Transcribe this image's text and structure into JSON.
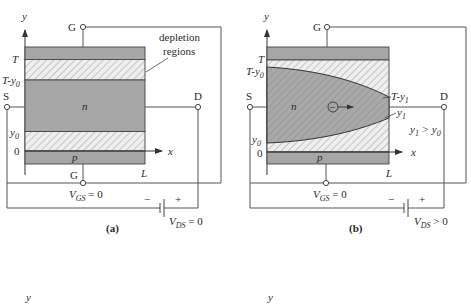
{
  "colors": {
    "channel": "#a6a6a6",
    "gate_region": "#a6a6a6",
    "depletion_bg": "#efefef",
    "hatch": "#9a9a9a",
    "wire": "#555555",
    "text": "#2a2a2a"
  },
  "panel_a": {
    "caption": "(a)",
    "axis_y": "y",
    "axis_x": "x",
    "terminal_gate_top": "G",
    "terminal_gate_bottom": "G",
    "terminal_source": "S",
    "terminal_drain": "D",
    "level_T": "T",
    "level_T_minus_y0": "T-y",
    "level_T_minus_y0_sub": "0",
    "level_y0": "y",
    "level_y0_sub": "0",
    "level_zero": "0",
    "length_label": "L",
    "channel_label": "n",
    "gate_bottom_label": "p",
    "annotation_line1": "depletion",
    "annotation_line2": "regions",
    "vgs_main": "V",
    "vgs_sub": "GS",
    "vgs_rest": " = 0",
    "vds_main": "V",
    "vds_sub": "DS",
    "vds_rest": " = 0",
    "battery_minus": "−",
    "battery_plus": "+"
  },
  "panel_b": {
    "caption": "(b)",
    "axis_y": "y",
    "axis_x": "x",
    "terminal_gate_top": "G",
    "terminal_source": "S",
    "terminal_drain": "D",
    "level_T": "T",
    "level_T_minus_y0": "T-y",
    "level_T_minus_y0_sub": "0",
    "level_y0": "y",
    "level_y0_sub": "0",
    "level_zero": "0",
    "level_T_minus_y1": "T-y",
    "level_T_minus_y1_sub": "1",
    "level_y1": "y",
    "level_y1_sub": "1",
    "inequality_a": "y",
    "inequality_a_sub": "1",
    "inequality_op": " > y",
    "inequality_b_sub": "0",
    "length_label": "L",
    "channel_label": "n",
    "gate_bottom_label": "p",
    "electron_symbol": "−",
    "vgs_main": "V",
    "vgs_sub": "GS",
    "vgs_rest": " = 0",
    "vds_main": "V",
    "vds_sub": "DS",
    "vds_rest": " > 0",
    "battery_minus": "−",
    "battery_plus": "+"
  },
  "bottom_fragments": {
    "left": "y",
    "right": "y"
  }
}
